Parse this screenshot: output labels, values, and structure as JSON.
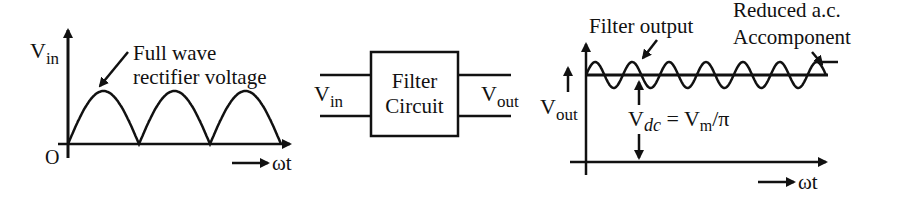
{
  "input_graph": {
    "y_label_main": "V",
    "y_label_sub": "in",
    "origin_label": "O",
    "x_label": "ωt",
    "annotation_line1": "Full wave",
    "annotation_line2": "rectifier voltage",
    "half_cycles": 3
  },
  "filter_block": {
    "input_label_main": "V",
    "input_label_sub": "in",
    "title_line1": "Filter",
    "title_line2": "Circuit",
    "output_label_main": "V",
    "output_label_sub": "out"
  },
  "output_graph": {
    "y_label_main": "V",
    "y_label_sub": "out",
    "x_label": "ωt",
    "filter_output_label": "Filter output",
    "ripple_label_line1": "Reduced a.c.",
    "ripple_label_line2": "Accomponent",
    "vdc_main": "V",
    "vdc_sub": "dc",
    "vdc_equals": " = V",
    "vdc_m_sub": "m",
    "vdc_tail": "/π",
    "ripple_cycles": 6.5
  },
  "colors": {
    "ink": "#111111",
    "background": "#ffffff"
  }
}
